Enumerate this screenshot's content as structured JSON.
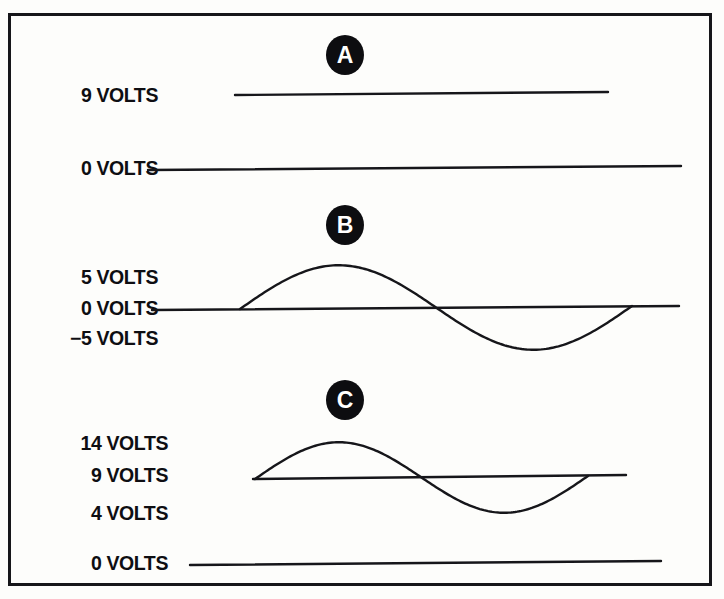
{
  "figure": {
    "ink_color": "#16161a",
    "background_color": "#fdfdfb"
  },
  "panels": [
    {
      "id": "A",
      "marker_label": "A",
      "labels": [
        {
          "text": "9 VOLTS",
          "value": 9
        },
        {
          "text": "0 VOLTS",
          "value": 0
        }
      ]
    },
    {
      "id": "B",
      "marker_label": "B",
      "labels": [
        {
          "text": "5 VOLTS",
          "value": 5
        },
        {
          "text": "0 VOLTS",
          "value": 0
        },
        {
          "text": "−5 VOLTS",
          "value": -5
        }
      ]
    },
    {
      "id": "C",
      "marker_label": "C",
      "labels": [
        {
          "text": "14 VOLTS",
          "value": 14
        },
        {
          "text": "9 VOLTS",
          "value": 9
        },
        {
          "text": "4 VOLTS",
          "value": 4
        },
        {
          "text": "0 VOLTS",
          "value": 0
        }
      ]
    }
  ],
  "chart_data": {
    "type": "line",
    "xlabel": "",
    "ylabel": "Volts",
    "grid": false,
    "legend": "none",
    "panels": [
      {
        "id": "A",
        "description": "Steady 9 volt DC level above a 0 volt reference line",
        "tick_labels": [
          "9 VOLTS",
          "0 VOLTS"
        ],
        "tick_values": [
          9,
          0
        ],
        "series": [
          {
            "name": "9 V DC level",
            "waveform": "constant",
            "value": 9
          },
          {
            "name": "0 V reference",
            "waveform": "constant",
            "value": 0
          }
        ]
      },
      {
        "id": "B",
        "description": "Sine wave alternating between +5 and -5 volts about a 0 volt axis",
        "tick_labels": [
          "5 VOLTS",
          "0 VOLTS",
          "−5 VOLTS"
        ],
        "tick_values": [
          5,
          0,
          -5
        ],
        "series": [
          {
            "name": "0 V axis",
            "waveform": "constant",
            "value": 0
          },
          {
            "name": "AC sine",
            "waveform": "sine",
            "offset": 0,
            "amplitude": 5,
            "peak": 5,
            "trough": -5,
            "cycles": 1
          }
        ]
      },
      {
        "id": "C",
        "description": "Same sine wave riding on a 9 volt DC offset, swinging between 4 and 14 volts, with a 0 volt reference line below",
        "tick_labels": [
          "14 VOLTS",
          "9 VOLTS",
          "4 VOLTS",
          "0 VOLTS"
        ],
        "tick_values": [
          14,
          9,
          4,
          0
        ],
        "series": [
          {
            "name": "9 V DC axis",
            "waveform": "constant",
            "value": 9
          },
          {
            "name": "AC sine on DC offset",
            "waveform": "sine",
            "offset": 9,
            "amplitude": 5,
            "peak": 14,
            "trough": 4,
            "cycles": 1
          },
          {
            "name": "0 V reference",
            "waveform": "constant",
            "value": 0
          }
        ]
      }
    ]
  }
}
